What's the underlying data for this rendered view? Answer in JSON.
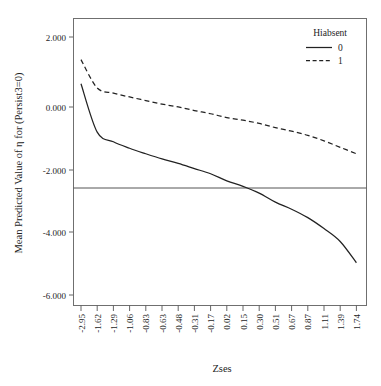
{
  "chart_data": {
    "type": "line",
    "title": "",
    "xlabel": "Zses",
    "ylabel": "Mean Predicted Value of η for (Persist3=0)",
    "categories": [
      "-2.95",
      "-1.62",
      "-1.29",
      "-1.06",
      "-0.83",
      "-0.63",
      "-0.48",
      "-0.31",
      "-0.17",
      "0.02",
      "0.15",
      "0.30",
      "0.51",
      "0.67",
      "0.87",
      "1.11",
      "1.39",
      "1.74"
    ],
    "x": [
      -2.95,
      -1.62,
      -1.29,
      -1.06,
      -0.83,
      -0.63,
      -0.48,
      -0.31,
      -0.17,
      0.02,
      0.15,
      0.3,
      0.51,
      0.67,
      0.87,
      1.11,
      1.39,
      1.74
    ],
    "ylim": [
      -7.0,
      2.6
    ],
    "xlim": [
      -3.25,
      2.05
    ],
    "yticks": [
      2.0,
      0.0,
      -2.0,
      -4.0,
      -6.0
    ],
    "ytick_labels": [
      "2.000",
      "0.000",
      "-2.000",
      "-4.000",
      "-6.000"
    ],
    "grid": false,
    "legend_position": "top-right",
    "reference_line": {
      "orientation": "horizontal",
      "y": -2.55,
      "label": ""
    },
    "series": [
      {
        "name": "0",
        "style": "solid",
        "values": [
          0.55,
          -0.95,
          -1.25,
          -1.45,
          -1.62,
          -1.78,
          -1.92,
          -2.08,
          -2.24,
          -2.46,
          -2.63,
          -2.84,
          -3.12,
          -3.34,
          -3.6,
          -3.94,
          -4.34,
          -5.0
        ]
      },
      {
        "name": "1",
        "style": "dashed",
        "values": [
          1.3,
          0.42,
          0.26,
          0.14,
          0.03,
          -0.08,
          -0.17,
          -0.28,
          -0.38,
          -0.5,
          -0.58,
          -0.68,
          -0.81,
          -0.92,
          -1.05,
          -1.22,
          -1.42,
          -1.62
        ]
      }
    ]
  },
  "legend": {
    "title": "Hiabsent",
    "entries": [
      {
        "label": "0",
        "style": "solid"
      },
      {
        "label": "1",
        "style": "dashed"
      }
    ]
  },
  "axes": {
    "x_label": "Zses",
    "y_label": "Mean Predicted Value of η for (Persist3=0)"
  }
}
